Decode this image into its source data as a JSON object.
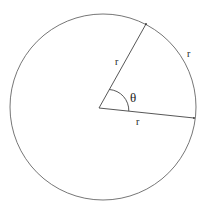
{
  "diagram": {
    "labels": {
      "radius_upper": "r",
      "arc": "r",
      "radius_lower": "r",
      "angle": "θ"
    },
    "colors": {
      "stroke": "#555555",
      "text": "#222222",
      "background": "#ffffff"
    }
  }
}
